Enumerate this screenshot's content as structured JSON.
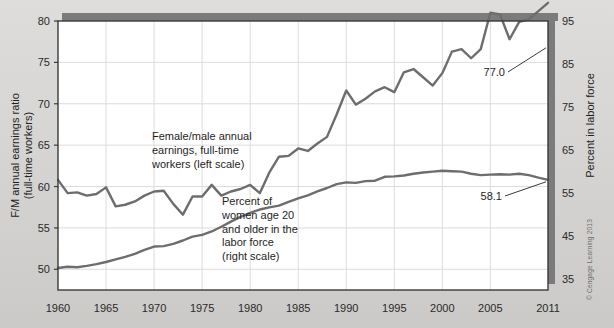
{
  "figure": {
    "background_color": "#d6d5d3",
    "plot_background_color": "#ffffff",
    "grid_color": "#dcdcdc",
    "frame_color": "#3a3a3a",
    "shadow_color": "#7b7b7b",
    "credit": "© Cengage Learning 2013"
  },
  "chart_data": {
    "type": "line",
    "title": "",
    "xlabel": "",
    "ylabel": "F/M annual earnings ratio (full-time workers)",
    "y2label": "Percent in labor force",
    "xlim": [
      1960,
      2011
    ],
    "ylim": [
      47.5,
      80
    ],
    "y2lim": [
      32.5,
      95
    ],
    "grid": true,
    "legend": "annotations-inline",
    "xticks": [
      1960,
      1965,
      1970,
      1975,
      1980,
      1985,
      1990,
      1995,
      2000,
      2005,
      2011
    ],
    "xtick_labels": [
      "1960",
      "1965",
      "1970",
      "1975",
      "1980",
      "1985",
      "1990",
      "1995",
      "2000",
      "2005",
      "2011"
    ],
    "yticks": [
      50,
      55,
      60,
      65,
      70,
      75,
      80
    ],
    "ytick_labels": [
      "50",
      "55",
      "60",
      "65",
      "70",
      "75",
      "80"
    ],
    "y2ticks": [
      35,
      45,
      55,
      65,
      75,
      85,
      95
    ],
    "y2tick_labels": [
      "35",
      "45",
      "55",
      "65",
      "75",
      "85",
      "95"
    ],
    "line_color": "#6d6d6d",
    "series": [
      {
        "name": "Female/male annual earnings, full-time workers (left scale)",
        "axis": "left",
        "color": "#6d6d6d",
        "x": [
          1960,
          1961,
          1962,
          1963,
          1964,
          1965,
          1966,
          1967,
          1968,
          1969,
          1970,
          1971,
          1972,
          1973,
          1974,
          1975,
          1976,
          1977,
          1978,
          1979,
          1980,
          1981,
          1982,
          1983,
          1984,
          1985,
          1986,
          1987,
          1988,
          1989,
          1990,
          1991,
          1992,
          1993,
          1994,
          1995,
          1996,
          1997,
          1998,
          1999,
          2000,
          2001,
          2002,
          2003,
          2004,
          2005,
          2006,
          2007,
          2008,
          2009,
          2010,
          2011
        ],
        "values": [
          60.8,
          59.2,
          59.3,
          58.9,
          59.1,
          59.9,
          57.6,
          57.8,
          58.2,
          58.9,
          59.4,
          59.5,
          57.9,
          56.6,
          58.8,
          58.8,
          60.2,
          58.9,
          59.4,
          59.7,
          60.2,
          59.2,
          61.7,
          63.6,
          63.7,
          64.6,
          64.3,
          65.2,
          66.0,
          68.7,
          71.6,
          69.9,
          70.6,
          71.5,
          72.0,
          71.4,
          73.8,
          74.2,
          73.2,
          72.2,
          73.7,
          76.3,
          76.6,
          75.5,
          76.6,
          81.0,
          80.8,
          77.8,
          79.9,
          80.2,
          81.2,
          82.2
        ],
        "start_value": 60.8,
        "end_value": 77.0,
        "end_label": "77.0"
      },
      {
        "name": "Percent of women age 20 and older in the labor force (right scale)",
        "axis": "right",
        "color": "#6d6d6d",
        "x": [
          1960,
          1961,
          1962,
          1963,
          1964,
          1965,
          1966,
          1967,
          1968,
          1969,
          1970,
          1971,
          1972,
          1973,
          1974,
          1975,
          1976,
          1977,
          1978,
          1979,
          1980,
          1981,
          1982,
          1983,
          1984,
          1985,
          1986,
          1987,
          1988,
          1989,
          1990,
          1991,
          1992,
          1993,
          1994,
          1995,
          1996,
          1997,
          1998,
          1999,
          2000,
          2001,
          2002,
          2003,
          2004,
          2005,
          2006,
          2007,
          2008,
          2009,
          2010,
          2011
        ],
        "values": [
          37.6,
          37.9,
          37.8,
          38.1,
          38.5,
          39.0,
          39.6,
          40.2,
          40.9,
          41.8,
          42.6,
          42.7,
          43.2,
          44.0,
          44.9,
          45.3,
          46.1,
          47.2,
          48.4,
          49.5,
          50.4,
          51.2,
          51.7,
          52.1,
          53.0,
          53.8,
          54.5,
          55.4,
          56.2,
          57.1,
          57.5,
          57.4,
          57.8,
          57.9,
          58.8,
          58.9,
          59.1,
          59.5,
          59.8,
          60.0,
          60.2,
          60.1,
          60.0,
          59.5,
          59.2,
          59.3,
          59.4,
          59.3,
          59.5,
          59.2,
          58.6,
          58.1
        ],
        "start_value": 37.6,
        "end_value": 58.1,
        "end_label": "58.1"
      }
    ],
    "annotations": [
      {
        "name": "fm-earnings-annotation",
        "lines": [
          "Female/male annual",
          "earnings, full-time",
          "workers (left scale)"
        ]
      },
      {
        "name": "labor-force-annotation",
        "lines": [
          "Percent of",
          "women age 20",
          "and older in the",
          "labor force",
          "(right scale)"
        ]
      }
    ]
  }
}
